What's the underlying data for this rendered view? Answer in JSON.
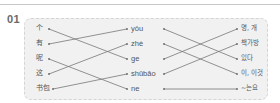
{
  "question_number": "01",
  "exercise": {
    "type": "three-column matching",
    "rows": 5,
    "columns": {
      "hanzi": [
        "个",
        "有",
        "呢",
        "这",
        "书包"
      ],
      "pinyin": [
        "yǒu",
        "zhè",
        "ge",
        "shūbāo",
        "ne"
      ],
      "korean": [
        "명, 개",
        "책가방",
        "있다",
        "이, 이것",
        "~는요"
      ]
    },
    "connections_hanzi_to_pinyin": [
      [
        0,
        2
      ],
      [
        1,
        0
      ],
      [
        2,
        4
      ],
      [
        3,
        1
      ],
      [
        4,
        3
      ]
    ],
    "connections_pinyin_to_korean": [
      [
        0,
        2
      ],
      [
        1,
        3
      ],
      [
        2,
        0
      ],
      [
        3,
        1
      ],
      [
        4,
        4
      ]
    ]
  },
  "colors": {
    "box_bg": "#f1f1f1",
    "line": "#777777",
    "text": "#555555",
    "number": "#6a6a6a"
  }
}
